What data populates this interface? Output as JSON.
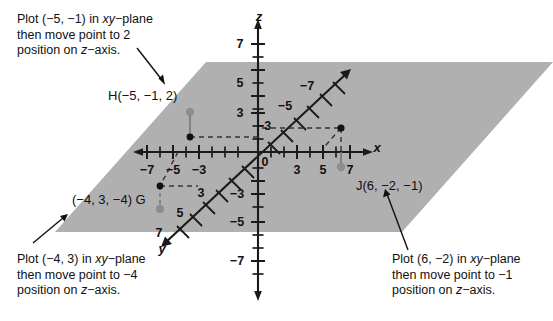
{
  "figure": {
    "colors": {
      "plane_fill": "#b0b0b0",
      "axis": "#1a1a1a",
      "dashed": "#333333",
      "point_solid": "#111111",
      "point_open": "#8a8a8a",
      "text": "#111111",
      "background": "#ffffff"
    }
  },
  "axes": {
    "z": {
      "name": "z",
      "positive_labels": [
        "7",
        "5",
        "3"
      ],
      "negative_labels": [
        "-3",
        "-5",
        "-7"
      ],
      "origin_label": "0"
    },
    "x": {
      "name": "x",
      "positive_labels": [
        "3",
        "5",
        "7"
      ],
      "negative_labels": [
        "-7",
        "-5",
        "-3"
      ]
    },
    "y": {
      "name": "y",
      "positive_labels": [
        "3",
        "5",
        "7"
      ],
      "negative_labels": [
        "-3",
        "-5",
        "-7"
      ]
    }
  },
  "points": [
    {
      "id": "H",
      "label": "H(-5, -1, 2)",
      "coords": [
        -5,
        -1,
        2
      ],
      "base_point": "solid",
      "top_point": "open"
    },
    {
      "id": "G",
      "label": "(-4, 3, -4) G",
      "coords": [
        -4,
        3,
        -4
      ],
      "base_point": "solid",
      "top_point": "open"
    },
    {
      "id": "J",
      "label": "J(6, -2, -1)",
      "coords": [
        6,
        -2,
        -1
      ],
      "base_point": "solid",
      "top_point": "open"
    }
  ],
  "callouts": [
    {
      "id": "callout-h",
      "line1_a": "Plot (-5, -1) in ",
      "line1_it": "xy",
      "line1_b": "-plane",
      "line2": "then move point to 2",
      "line3_a": "position on ",
      "line3_it": "z",
      "line3_b": "-axis."
    },
    {
      "id": "callout-g",
      "line1_a": "Plot (-4, 3) in ",
      "line1_it": "xy",
      "line1_b": "-plane",
      "line2": "then move point to -4",
      "line3_a": "position on ",
      "line3_it": "z",
      "line3_b": "-axis."
    },
    {
      "id": "callout-j",
      "line1_a": "Plot (6, -2) in ",
      "line1_it": "xy",
      "line1_b": "-plane",
      "line2": "then move point to -1",
      "line3_a": "position on ",
      "line3_it": "z",
      "line3_b": "-axis."
    }
  ],
  "tick_labels": {
    "z_pos": [
      {
        "text": "7",
        "x": 240,
        "y": 44
      },
      {
        "text": "5",
        "x": 240,
        "y": 83
      },
      {
        "text": "3",
        "x": 240,
        "y": 113
      }
    ],
    "z_neg": [
      {
        "text": "-3",
        "x": 237,
        "y": 194
      },
      {
        "text": "-5",
        "x": 237,
        "y": 222
      },
      {
        "text": "-7",
        "x": 237,
        "y": 261
      }
    ],
    "x_pos": [
      {
        "text": "3",
        "x": 297,
        "y": 170
      },
      {
        "text": "5",
        "x": 323,
        "y": 170
      },
      {
        "text": "7",
        "x": 350,
        "y": 170
      }
    ],
    "x_neg": [
      {
        "text": "-7",
        "x": 147,
        "y": 170
      },
      {
        "text": "-5",
        "x": 173,
        "y": 170
      },
      {
        "text": "-3",
        "x": 199,
        "y": 170
      }
    ],
    "y_pos": [
      {
        "text": "3",
        "x": 201,
        "y": 193
      },
      {
        "text": "5",
        "x": 180,
        "y": 213
      },
      {
        "text": "7",
        "x": 159,
        "y": 233
      }
    ],
    "y_neg": [
      {
        "text": "-3",
        "x": 264,
        "y": 126
      },
      {
        "text": "-5",
        "x": 285,
        "y": 106
      },
      {
        "text": "-7",
        "x": 307,
        "y": 86
      }
    ],
    "origin": {
      "text": "0",
      "x": 265,
      "y": 162
    }
  },
  "axis_names": {
    "z": {
      "text": "z",
      "x": 259,
      "y": 16
    },
    "x": {
      "text": "x",
      "x": 377,
      "y": 147
    },
    "y": {
      "text": "y",
      "x": 162,
      "y": 248
    }
  },
  "point_labels": {
    "H": {
      "text": "H(-5, -1, 2)",
      "x": 108,
      "y": 88
    },
    "G": {
      "text": "(-4, 3, -4) G",
      "x": 72,
      "y": 192
    },
    "J": {
      "text": "J(6, -2, -1)",
      "x": 356,
      "y": 178
    }
  }
}
